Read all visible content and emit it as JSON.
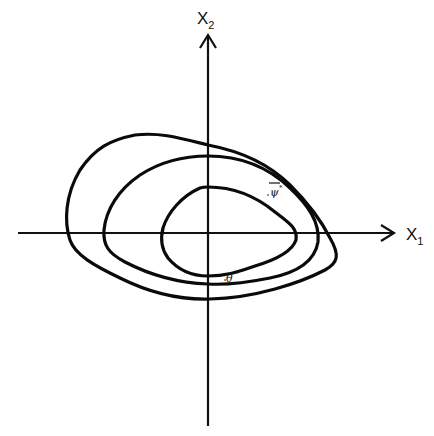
{
  "diagram": {
    "type": "phase-plane-level-sets",
    "axes": {
      "x": {
        "label": "X",
        "subscript": "1"
      },
      "y": {
        "label": "X",
        "subscript": "2"
      }
    },
    "curves": [
      {
        "name": "outer-closed-curve"
      },
      {
        "name": "middle-closed-curve"
      },
      {
        "name": "inner-closed-curve"
      }
    ],
    "annotations": [
      {
        "name": "psi-star",
        "symbol": "ψ",
        "overbar": true,
        "superscript": "*"
      },
      {
        "name": "theta-star",
        "symbol": "θ",
        "superscript": "*"
      }
    ]
  }
}
